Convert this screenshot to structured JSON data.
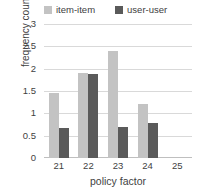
{
  "chart_data": {
    "type": "bar",
    "title": "",
    "xlabel": "policy factor",
    "ylabel": "frequency count",
    "categories": [
      "21",
      "22",
      "23",
      "24",
      "25"
    ],
    "series": [
      {
        "name": "item-item",
        "color": "#c3c3c3",
        "values": [
          1.45,
          1.9,
          2.4,
          1.22,
          0
        ]
      },
      {
        "name": "user-user",
        "color": "#5a5a5a",
        "values": [
          0.67,
          1.87,
          0.7,
          0.78,
          0
        ]
      }
    ],
    "ylim": [
      0,
      3
    ],
    "yticks": [
      "0",
      "0.5",
      "1",
      "1.5",
      "2",
      "2.5",
      "3"
    ],
    "ytick_values": [
      0,
      0.5,
      1,
      1.5,
      2,
      2.5,
      3
    ],
    "grid": true,
    "legend_position": "top"
  }
}
